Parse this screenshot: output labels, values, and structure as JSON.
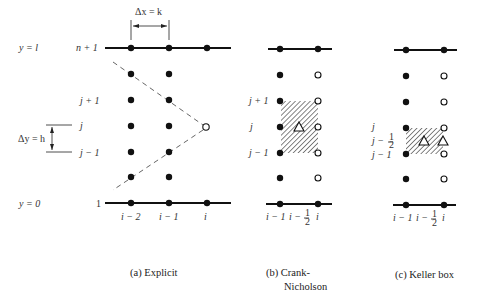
{
  "panels": {
    "a": {
      "caption": "(a)  Explicit",
      "dx_label": "Δx = k",
      "dy_label": "Δy = h",
      "y_top_label": "y = l",
      "y_bottom_label": "y = 0",
      "row_top_label": "n + 1",
      "row_bottom_label": "1",
      "row_labels": [
        "j + 1",
        "j",
        "j − 1"
      ],
      "col_labels": [
        "i − 2",
        "i − 1",
        "i"
      ]
    },
    "b": {
      "caption_line1": "(b)  Crank-",
      "caption_line2": "Nicholson",
      "row_labels": [
        "j + 1",
        "j",
        "j − 1"
      ],
      "col_labels": [
        "i − 1",
        "i − ",
        "i"
      ],
      "half": "1",
      "half_den": "2"
    },
    "c": {
      "caption": "(c)  Keller box",
      "row_labels": [
        "j",
        "j − ",
        "j − 1"
      ],
      "col_labels": [
        "i − 1",
        "i − ",
        "i"
      ],
      "half": "1",
      "half_den": "2"
    }
  },
  "legend": {
    "filled_dot": "known-value-node",
    "open_circle": "unknown-value-node",
    "triangle": "centered-difference-point",
    "hatched": "difference-molecule-region"
  }
}
